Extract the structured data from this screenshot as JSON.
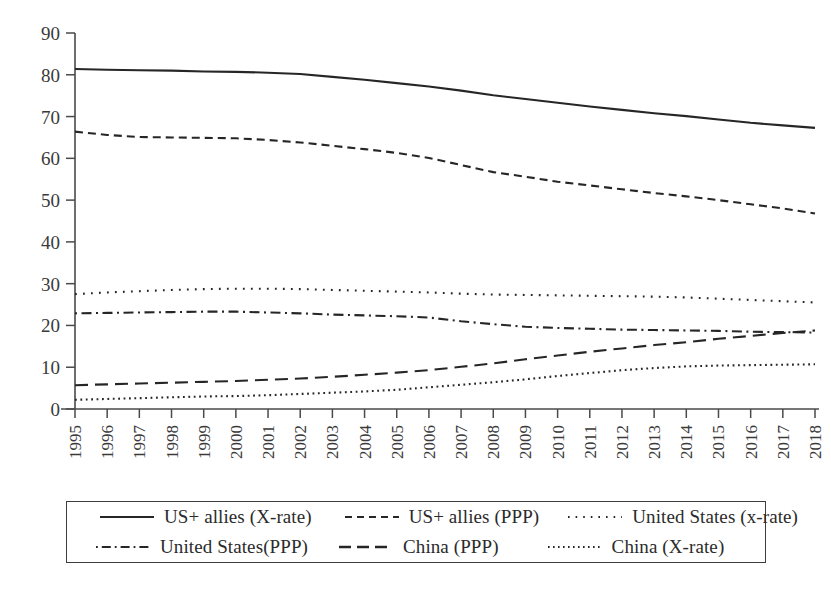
{
  "chart_data": {
    "type": "line",
    "title": "",
    "xlabel": "",
    "ylabel": "",
    "ylim": [
      0,
      90
    ],
    "ytick_step": 10,
    "grid": false,
    "legend_position": "bottom",
    "categories": [
      "1995",
      "1996",
      "1997",
      "1998",
      "1999",
      "2000",
      "2001",
      "2002",
      "2003",
      "2004",
      "2005",
      "2006",
      "2007",
      "2008",
      "2009",
      "2010",
      "2011",
      "2012",
      "2013",
      "2014",
      "2015",
      "2016",
      "2017",
      "2018"
    ],
    "yticks": [
      0,
      10,
      20,
      30,
      40,
      50,
      60,
      70,
      80,
      90
    ],
    "series": [
      {
        "name": "US+ allies (X-rate)",
        "style": "solid",
        "values": [
          81.4,
          81.2,
          81.1,
          81.0,
          80.8,
          80.7,
          80.5,
          80.2,
          79.5,
          78.8,
          78.0,
          77.2,
          76.2,
          75.1,
          74.2,
          73.3,
          72.4,
          71.6,
          70.8,
          70.1,
          69.3,
          68.5,
          67.9,
          67.3
        ]
      },
      {
        "name": "US+ allies (PPP)",
        "style": "dashed",
        "values": [
          66.4,
          65.6,
          65.1,
          65.0,
          64.9,
          64.8,
          64.4,
          63.8,
          63.0,
          62.2,
          61.3,
          60.1,
          58.4,
          56.7,
          55.6,
          54.4,
          53.5,
          52.6,
          51.7,
          50.9,
          50.0,
          49.0,
          48.0,
          46.8
        ]
      },
      {
        "name": "United States (x-rate)",
        "style": "dotted",
        "values": [
          27.5,
          27.9,
          28.2,
          28.5,
          28.7,
          28.8,
          28.8,
          28.7,
          28.5,
          28.3,
          28.1,
          27.9,
          27.6,
          27.4,
          27.3,
          27.2,
          27.1,
          27.0,
          26.9,
          26.7,
          26.4,
          26.1,
          25.8,
          25.5
        ]
      },
      {
        "name": "United States(PPP)",
        "style": "dashdot",
        "values": [
          22.9,
          23.0,
          23.1,
          23.2,
          23.3,
          23.3,
          23.1,
          22.9,
          22.6,
          22.4,
          22.2,
          21.9,
          21.0,
          20.3,
          19.7,
          19.4,
          19.2,
          19.0,
          18.9,
          18.8,
          18.7,
          18.5,
          18.4,
          18.3
        ]
      },
      {
        "name": "China (PPP)",
        "style": "longdash",
        "values": [
          5.7,
          5.9,
          6.1,
          6.3,
          6.5,
          6.7,
          7.0,
          7.3,
          7.7,
          8.2,
          8.7,
          9.3,
          10.1,
          10.9,
          11.9,
          12.8,
          13.7,
          14.5,
          15.3,
          16.0,
          16.8,
          17.5,
          18.2,
          18.8
        ]
      },
      {
        "name": "China (X-rate)",
        "style": "finedot",
        "values": [
          2.2,
          2.4,
          2.6,
          2.8,
          3.0,
          3.1,
          3.3,
          3.6,
          3.9,
          4.2,
          4.6,
          5.2,
          5.8,
          6.4,
          7.1,
          7.9,
          8.6,
          9.3,
          9.8,
          10.2,
          10.4,
          10.5,
          10.6,
          10.7
        ]
      }
    ]
  },
  "legend": {
    "items": [
      {
        "label": "US+ allies (X-rate)",
        "style": "solid"
      },
      {
        "label": "US+ allies (PPP)",
        "style": "dashed"
      },
      {
        "label": "United States (x-rate)",
        "style": "dotted"
      },
      {
        "label": "United States(PPP)",
        "style": "dashdot"
      },
      {
        "label": "China (PPP)",
        "style": "longdash"
      },
      {
        "label": "China (X-rate)",
        "style": "finedot"
      }
    ]
  },
  "colors": {
    "line": "#262626",
    "axis": "#4a4a4a",
    "text": "#2b2b2b",
    "background": "#ffffff"
  }
}
